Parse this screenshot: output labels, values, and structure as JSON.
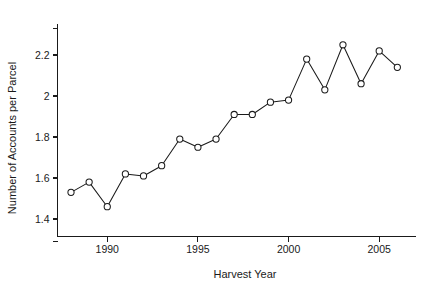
{
  "chart_data": {
    "type": "line",
    "title": "",
    "subtitle": "",
    "xlabel": "Harvest Year",
    "ylabel": "Number of Accounts per Parcel",
    "x": [
      1988,
      1989,
      1990,
      1991,
      1992,
      1993,
      1994,
      1995,
      1996,
      1997,
      1998,
      1999,
      2000,
      2001,
      2002,
      2003,
      2004,
      2005,
      2006
    ],
    "values": [
      1.53,
      1.58,
      1.46,
      1.62,
      1.61,
      1.66,
      1.79,
      1.75,
      1.79,
      1.91,
      1.91,
      1.97,
      1.98,
      2.18,
      2.03,
      2.25,
      2.06,
      2.22,
      2.14
    ],
    "series": [
      {
        "name": "Number of Accounts per Parcel",
        "values": [
          1.53,
          1.58,
          1.46,
          1.62,
          1.61,
          1.66,
          1.79,
          1.75,
          1.79,
          1.91,
          1.91,
          1.97,
          1.98,
          2.18,
          2.03,
          2.25,
          2.06,
          2.22,
          2.14
        ]
      }
    ],
    "xlim": [
      1987.3,
      2006.9
    ],
    "ylim": [
      1.29,
      2.33
    ],
    "xticks": [
      1990,
      1995,
      2000,
      2005
    ],
    "xtick_labels": [
      "1990",
      "1995",
      "2000",
      "2005"
    ],
    "yticks": [
      1.4,
      1.6,
      1.8,
      2.0,
      2.2
    ],
    "ytick_labels": [
      "1.4",
      "1.6",
      "1.8",
      "2",
      "2.2"
    ],
    "y_axis_end_ticks": [
      1.29,
      2.33
    ],
    "grid": false,
    "legend": false,
    "legend_position": "none",
    "marker": "open-circle",
    "line_color": "#1a1a1a",
    "marker_fill": "#ffffff",
    "background": "#ffffff"
  },
  "axes": {
    "y_title": "Number of Accounts per Parcel",
    "x_title": "Harvest Year"
  }
}
